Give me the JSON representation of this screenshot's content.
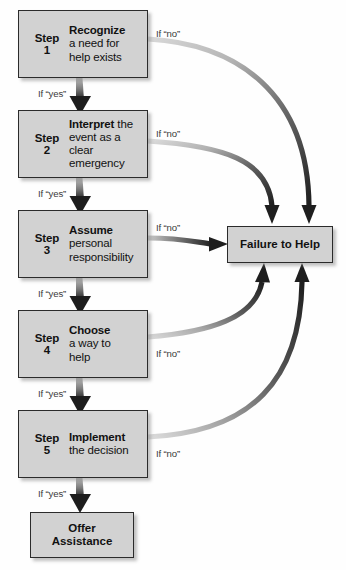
{
  "diagram": {
    "decision_target": {
      "label": "Failure to Help"
    },
    "outcome": {
      "line1": "Offer",
      "line2": "Assistance"
    },
    "yes_label": "If “yes”",
    "no_label": "If “no”",
    "colors": {
      "box_fill": "#d2d2d2",
      "box_border": "#2b2b2b",
      "arrow_dark": "#1e1e1e",
      "arrow_light": "#cfcfcf",
      "text": "#111111",
      "label_text": "#3a3a3a",
      "background": "#fefefe"
    },
    "steps": [
      {
        "step_word": "Step",
        "step_number": "1",
        "head": "Recognize",
        "rest_line1": "a need for",
        "rest_line2": "help exists",
        "inline_tail": "",
        "yes": "If “yes”",
        "no": "If “no”"
      },
      {
        "step_word": "Step",
        "step_number": "2",
        "head": "Interpret",
        "inline_tail": " the",
        "rest_line1": "event as a clear",
        "rest_line2": "emergency",
        "yes": "If “yes”",
        "no": "If “no”"
      },
      {
        "step_word": "Step",
        "step_number": "3",
        "head": "Assume",
        "inline_tail": "",
        "rest_line1": "personal",
        "rest_line2": "responsibility",
        "yes": "If “yes”",
        "no": "If “no”"
      },
      {
        "step_word": "Step",
        "step_number": "4",
        "head": "Choose",
        "inline_tail": "",
        "rest_line1": "a way to",
        "rest_line2": "help",
        "yes": "If “yes”",
        "no": "If “no”"
      },
      {
        "step_word": "Step",
        "step_number": "5",
        "head": "Implement",
        "inline_tail": "",
        "rest_line1": "the decision",
        "rest_line2": "",
        "yes": "If “yes”",
        "no": "If “no”"
      }
    ]
  }
}
